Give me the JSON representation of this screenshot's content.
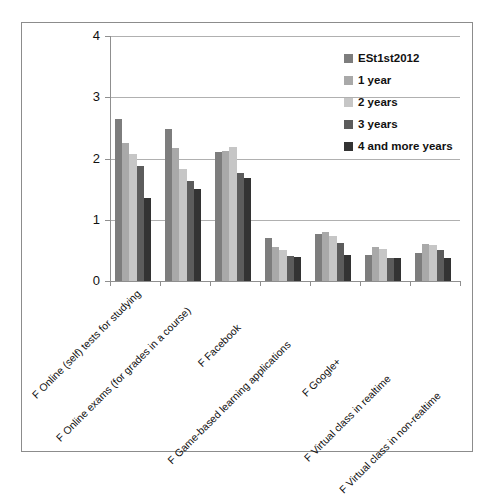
{
  "chart_data": {
    "type": "bar",
    "title": "",
    "subtitle": "",
    "xlabel": "",
    "ylabel": "",
    "ylim": [
      0,
      4
    ],
    "y_ticks": [
      "0",
      "1",
      "2",
      "3",
      "4"
    ],
    "grid": true,
    "legend_position": "top-right",
    "orientation": "vertical",
    "categories": [
      "F Online (self) tests for studying",
      "F Online exams (for grades in a course)",
      "F Facebook",
      "F Game-based learning applications",
      "F Google+",
      "F Virtual class in realtime",
      "F Virtual class in non-realtime"
    ],
    "series": [
      {
        "name": "ESt1st2012",
        "color": "#7d7d7d",
        "values": [
          2.65,
          2.48,
          2.1,
          0.71,
          0.76,
          0.43,
          0.45
        ]
      },
      {
        "name": "1 year",
        "color": "#a9a9a9",
        "values": [
          2.25,
          2.17,
          2.12,
          0.55,
          0.8,
          0.55,
          0.61
        ]
      },
      {
        "name": "2 years",
        "color": "#c6c6c6",
        "values": [
          2.08,
          1.83,
          2.18,
          0.5,
          0.73,
          0.53,
          0.58
        ]
      },
      {
        "name": "3 years",
        "color": "#5c5c5c",
        "values": [
          1.87,
          1.63,
          1.77,
          0.41,
          0.62,
          0.38,
          0.5
        ]
      },
      {
        "name": "4 and more years",
        "color": "#333333",
        "values": [
          1.36,
          1.5,
          1.68,
          0.4,
          0.43,
          0.38,
          0.38
        ]
      }
    ]
  },
  "legend": {
    "items": [
      {
        "label": "ESt1st2012",
        "color": "#7d7d7d"
      },
      {
        "label": "1 year",
        "color": "#a9a9a9"
      },
      {
        "label": "2 years",
        "color": "#c6c6c6"
      },
      {
        "label": "3 years",
        "color": "#5c5c5c"
      },
      {
        "label": "4 and more years",
        "color": "#333333"
      }
    ]
  },
  "axis": {
    "y_ticks": [
      "0",
      "1",
      "2",
      "3",
      "4"
    ],
    "x_labels": [
      "F Online (self) tests for studying",
      "F Online exams (for grades in a course)",
      "F Facebook",
      "F Game-based learning applications",
      "F Google+",
      "F Virtual class in realtime",
      "F Virtual class in non-realtime"
    ]
  }
}
